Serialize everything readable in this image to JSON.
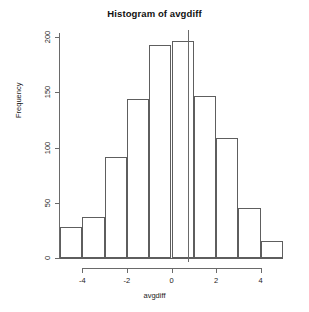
{
  "chart_data": {
    "type": "bar",
    "title": "Histogram of avgdiff",
    "xlabel": "avgdiff",
    "ylabel": "Frequency",
    "categories": [
      "-5 to -4",
      "-4 to -3",
      "-3 to -2",
      "-2 to -1",
      "-1 to 0",
      "0 to 1",
      "1 to 2",
      "2 to 3",
      "3 to 4",
      "4 to 5"
    ],
    "bin_edges": [
      -5,
      -4,
      -3,
      -2,
      -1,
      0,
      1,
      2,
      3,
      4,
      5
    ],
    "values": [
      28,
      37,
      91,
      144,
      193,
      196,
      147,
      109,
      45,
      15
    ],
    "xlim": [
      -5,
      5
    ],
    "ylim": [
      0,
      200
    ],
    "xticks": [
      -4,
      -2,
      0,
      2,
      4
    ],
    "xtick_labels": [
      "-4",
      "-2",
      "0",
      "2",
      "4"
    ],
    "yticks": [
      0,
      50,
      100,
      150,
      200
    ],
    "ytick_labels": [
      "0",
      "50",
      "100",
      "150",
      "200"
    ],
    "grid": false,
    "legend": false,
    "annotations": [
      {
        "name": "vertical-reference-line",
        "orientation": "vertical",
        "x": 0.72
      }
    ],
    "bar_fill": "#ffffff",
    "bar_border": "#5e5e5e",
    "axis_color": "#6a6a6a",
    "background": "#ffffff"
  }
}
